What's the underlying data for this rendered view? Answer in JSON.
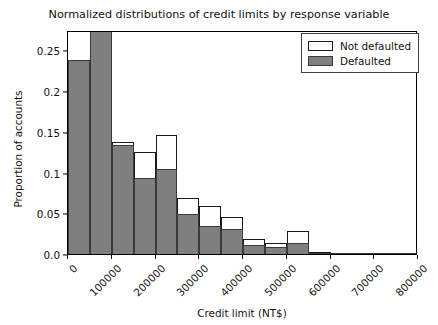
{
  "chart_data": {
    "type": "bar",
    "title": "Normalized distributions of credit limits by response variable",
    "xlabel": "Credit limit (NT$)",
    "ylabel": "Proportion of accounts",
    "xlim": [
      0,
      800000
    ],
    "ylim": [
      0.0,
      0.275
    ],
    "grid": false,
    "legend_position": "upper right",
    "bin_width": 50000,
    "bin_edges": [
      0,
      50000,
      100000,
      150000,
      200000,
      250000,
      300000,
      350000,
      400000,
      450000,
      500000,
      550000,
      600000,
      650000,
      700000,
      750000,
      800000
    ],
    "bin_centers": [
      25000,
      75000,
      125000,
      175000,
      225000,
      275000,
      325000,
      375000,
      425000,
      475000,
      525000,
      575000,
      625000,
      675000,
      725000,
      775000
    ],
    "xticks": [
      0,
      100000,
      200000,
      300000,
      400000,
      500000,
      600000,
      700000,
      800000
    ],
    "xtick_labels": [
      "0",
      "100000",
      "200000",
      "300000",
      "400000",
      "500000",
      "600000",
      "700000",
      "800000"
    ],
    "yticks": [
      0.0,
      0.05,
      0.1,
      0.15,
      0.2,
      0.25
    ],
    "ytick_labels": [
      "0.0",
      "0.05",
      "0.1",
      "0.15",
      "0.2",
      "0.25"
    ],
    "series": [
      {
        "name": "Not defaulted",
        "fill_color": "#ffffff",
        "edge_color": "#1a1a1a",
        "values": [
          0.118,
          0.222,
          0.138,
          0.125,
          0.146,
          0.069,
          0.059,
          0.046,
          0.019,
          0.014,
          0.028,
          0.002,
          0.001,
          0.001,
          0.001,
          0.001
        ]
      },
      {
        "name": "Defaulted",
        "fill_color": "#7f7f7f",
        "edge_color": "#3a3a3a",
        "values": [
          0.238,
          0.275,
          0.134,
          0.093,
          0.104,
          0.049,
          0.035,
          0.031,
          0.011,
          0.009,
          0.014,
          0.001,
          0.001,
          0.0005,
          0.0005,
          0.0005
        ]
      }
    ]
  },
  "legend": {
    "items": [
      {
        "label": "Not defaulted",
        "style": "nd"
      },
      {
        "label": "Defaulted",
        "style": "df"
      }
    ]
  }
}
